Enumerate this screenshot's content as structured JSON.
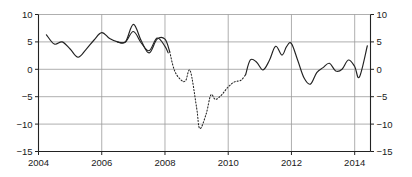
{
  "chart_data": {
    "type": "line",
    "title": "",
    "subtitle": "",
    "xlabel": "",
    "ylabel": "",
    "xlim": [
      2004,
      2014.5
    ],
    "ylim": [
      -15,
      10
    ],
    "grid": true,
    "legend": null,
    "x_ticks": [
      "2004",
      "2006",
      "2008",
      "2010",
      "2012",
      "2014"
    ],
    "x_tick_values": [
      2004,
      2006,
      2008,
      2010,
      2012,
      2014
    ],
    "y_ticks_left": [
      "10",
      "5",
      "0",
      "−5",
      "−10",
      "−15"
    ],
    "y_ticks_right": [
      "10",
      "5",
      "0",
      "−5",
      "−10",
      "−15"
    ],
    "y_tick_values": [
      10,
      5,
      0,
      -5,
      -10,
      -15
    ],
    "line_color": "#222222",
    "grid_color": "#9a9a9a",
    "axis_color": "#222222",
    "series": [
      {
        "name": "actual",
        "style": "solid",
        "x": [
          2004.25,
          2004.5,
          2004.75,
          2005.0,
          2005.25,
          2005.5,
          2005.75,
          2006.0,
          2006.25,
          2006.5,
          2006.75,
          2007.0,
          2007.25,
          2007.5,
          2007.75,
          2008.0,
          2008.1
        ],
        "values": [
          6.3,
          4.6,
          5.0,
          3.7,
          2.2,
          3.6,
          5.3,
          6.7,
          5.6,
          5.0,
          5.0,
          6.9,
          4.8,
          3.4,
          5.7,
          4.2,
          3.0
        ]
      },
      {
        "name": "actual-continued",
        "style": "solid",
        "x": [
          2006.5,
          2006.75,
          2007.0,
          2007.25,
          2007.5,
          2007.75,
          2008.0,
          2008.15
        ],
        "values": [
          5.0,
          5.0,
          8.2,
          5.2,
          3.0,
          5.5,
          5.5,
          3.2
        ]
      },
      {
        "name": "crisis-estimated",
        "style": "dotted",
        "x": [
          2008.15,
          2008.3,
          2008.5,
          2008.65,
          2008.8,
          2009.0,
          2009.1,
          2009.3,
          2009.45,
          2009.6,
          2009.8,
          2010.0,
          2010.2,
          2010.4,
          2010.55
        ],
        "values": [
          3.2,
          -0.2,
          -1.9,
          -2.1,
          -0.3,
          -7.0,
          -10.8,
          -8.2,
          -4.7,
          -5.5,
          -4.6,
          -3.2,
          -2.3,
          -2.0,
          -1.0
        ]
      },
      {
        "name": "recovery",
        "style": "solid",
        "x": [
          2010.55,
          2010.7,
          2010.9,
          2011.1,
          2011.3,
          2011.5,
          2011.7,
          2011.85,
          2012.0,
          2012.2,
          2012.4,
          2012.6,
          2012.8,
          2013.0,
          2013.2,
          2013.4,
          2013.6,
          2013.8,
          2014.0,
          2014.15,
          2014.4
        ],
        "values": [
          -1.0,
          1.7,
          1.3,
          -0.1,
          1.6,
          4.2,
          2.6,
          4.2,
          4.7,
          1.6,
          -1.6,
          -2.7,
          -0.6,
          0.3,
          1.1,
          -0.3,
          0.0,
          1.7,
          0.5,
          -1.4,
          4.3
        ]
      }
    ]
  }
}
